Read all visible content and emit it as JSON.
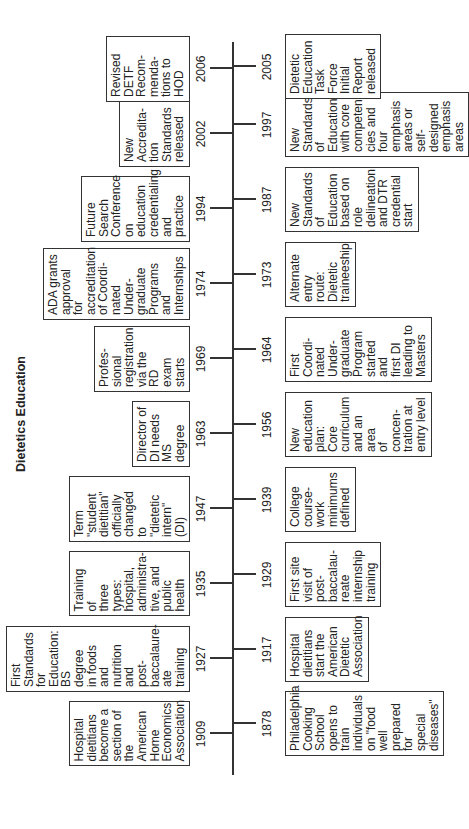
{
  "title": "Dietetics Education",
  "above": [
    {
      "year": "1909",
      "text": "Hospital\ndietitians\nbecome a\nsection of\nthe\nAmerican\nHome\nEconomics\nAssociation"
    },
    {
      "year": "1927",
      "text": "First\nStandards\nfor\nEducation:\nBS degree\nin foods\nand\nnutrition\nand\npost-\nbaccalaure-\nate training"
    },
    {
      "year": "1935",
      "text": "Training of\nthree types:\nhospital,\nadministra-\ntive, and\npublic\nhealth"
    },
    {
      "year": "1947",
      "text": "Term\n\"student\ndietitian\"\nofficially\nchanged\nto\n\"dietetic\nintern\"\n(DI)"
    },
    {
      "year": "1963",
      "text": "Director of\nDI needs\nMS\ndegree"
    },
    {
      "year": "1969",
      "text": "Profes-\nsional\nregistration\nvia the RD\nexam\nstarts"
    },
    {
      "year": "1974",
      "text": "ADA grants\napproval for\naccreditation\nof Coordi-\nnated\nUnder-\ngraduate\nPrograms\nand\nInternships"
    },
    {
      "year": "1994",
      "text": "Future\nSearch\nConference\non education\ncredentialing\nand practice"
    },
    {
      "year": "2002",
      "text": "New\nAccredita-\ntion\nStandards\nreleased"
    },
    {
      "year": "2006",
      "text": "Revised\nDETF\nRecom-\nmenda-\ntions to\nHOD"
    }
  ],
  "below": [
    {
      "year": "1878",
      "text": "Philadelphia\nCooking\nSchool\nopens to\ntrain\nindividuals\non \"food\nwell\nprepared for\nspecial\ndiseases\""
    },
    {
      "year": "1917",
      "text": "Hospital\ndietitians\nstart the\nAmerican\nDietetic\nAssociation"
    },
    {
      "year": "1929",
      "text": "First site\nvisit of\npost-\nbaccalau-\nreate\ninternship\ntraining"
    },
    {
      "year": "1939",
      "text": "College\ncourse-\nwork\nminimums\ndefined"
    },
    {
      "year": "1956",
      "text": "New\neducation\nplan: Core\ncurriculum\nand an area\nof concen-\ntration at\nentry level"
    },
    {
      "year": "1964",
      "text": "First\nCoordi-\nnated\nUnder-\ngraduate\nProgram\nstarted and\nfirst DI\nleading to\nMasters"
    },
    {
      "year": "1973",
      "text": "Alternate\nentry route:\nDietetic\ntraineeship"
    },
    {
      "year": "1987",
      "text": "New\nStandards\nof\nEducation\nbased on\nrole\ndelineation\nand DTR\ncredential\nstart"
    },
    {
      "year": "1997",
      "text": "New\nStandards\nof\nEducation\nwith core\ncompeten-\ncies and\nfour\nemphasis\nareas or\nself-\ndesigned\nemphasis\nareas"
    },
    {
      "year": "2005",
      "text": "Dietetic\nEducation\nTask Force\nInitial\nReport\nreleased"
    }
  ]
}
